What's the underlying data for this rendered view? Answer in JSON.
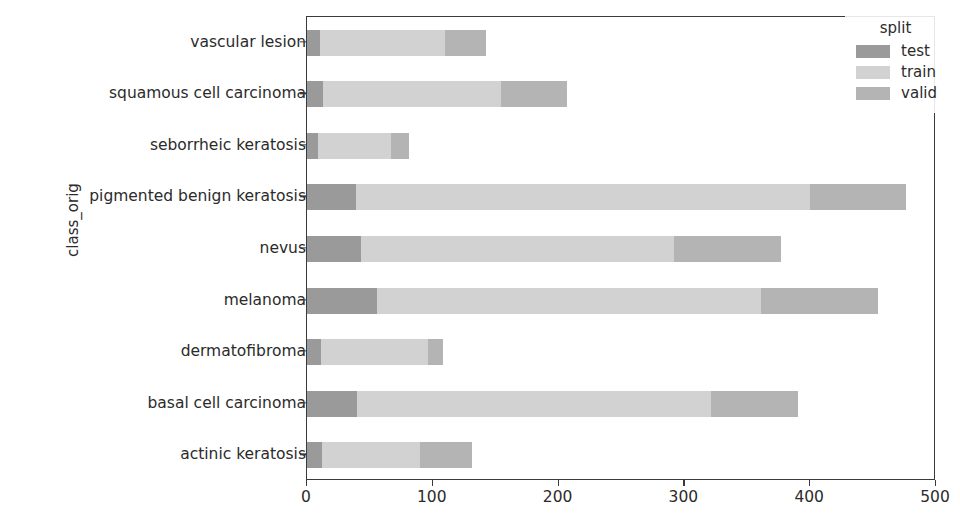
{
  "chart_data": {
    "type": "bar",
    "orientation": "horizontal",
    "stacked": true,
    "title": "",
    "xlabel": "",
    "ylabel": "class_orig",
    "xlim": [
      0,
      500
    ],
    "ylim_categories_top_to_bottom": true,
    "grid": false,
    "legend": {
      "title": "split",
      "position": "upper right",
      "entries": [
        "test",
        "train",
        "valid"
      ]
    },
    "xticks": [
      0,
      100,
      200,
      300,
      400,
      500
    ],
    "xtick_labels": [
      "0",
      "100",
      "200",
      "300",
      "400",
      "500"
    ],
    "categories": [
      "vascular lesion",
      "squamous cell carcinoma",
      "seborrheic keratosis",
      "pigmented benign keratosis",
      "nevus",
      "melanoma",
      "dermatofibroma",
      "basal cell carcinoma",
      "actinic keratosis"
    ],
    "series": [
      {
        "name": "test",
        "color": "#9a9a9a",
        "values": [
          10,
          13,
          9,
          39,
          43,
          56,
          11,
          40,
          12
        ]
      },
      {
        "name": "train",
        "color": "#d2d2d2",
        "values": [
          100,
          141,
          58,
          361,
          249,
          305,
          85,
          281,
          78
        ]
      },
      {
        "name": "valid",
        "color": "#b4b4b4",
        "values": [
          32,
          53,
          14,
          76,
          85,
          93,
          12,
          69,
          41
        ]
      }
    ],
    "totals": [
      142,
      207,
      81,
      476,
      377,
      454,
      108,
      390,
      131
    ]
  },
  "style": {
    "axes_edge_color": "#3a3a3a",
    "text_color": "#2b2b2b",
    "background": "#ffffff"
  }
}
